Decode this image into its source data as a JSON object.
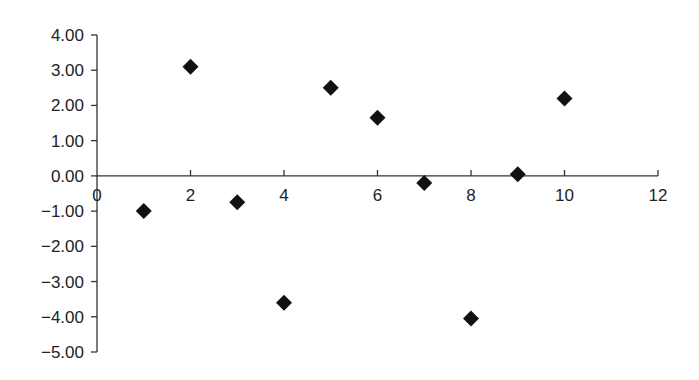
{
  "chart_data": {
    "type": "scatter",
    "title": "",
    "xlabel": "",
    "ylabel": "",
    "xlim": [
      0,
      12
    ],
    "ylim": [
      -5,
      4
    ],
    "x_ticks": [
      0,
      2,
      4,
      6,
      8,
      10,
      12
    ],
    "x_tick_labels": [
      "0",
      "2",
      "4",
      "6",
      "8",
      "10",
      "12"
    ],
    "y_ticks": [
      4,
      3,
      2,
      1,
      0,
      -1,
      -2,
      -3,
      -4,
      -5
    ],
    "y_tick_labels": [
      "4.00",
      "3.00",
      "2.00",
      "1.00",
      "0.00",
      "−1.00",
      "−2.00",
      "−3.00",
      "−4.00",
      "−5.00"
    ],
    "grid": false,
    "legend": null,
    "marker": "diamond",
    "marker_color": "#111111",
    "series": [
      {
        "name": "",
        "x": [
          1,
          2,
          3,
          4,
          5,
          6,
          7,
          8,
          9,
          10
        ],
        "y": [
          -1.0,
          3.1,
          -0.75,
          -3.6,
          2.5,
          1.65,
          -0.2,
          -4.05,
          0.05,
          2.2
        ]
      }
    ]
  }
}
